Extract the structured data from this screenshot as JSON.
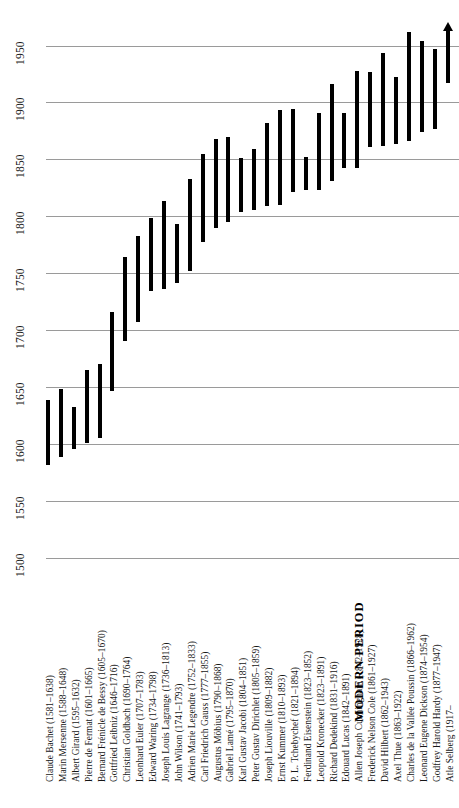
{
  "chart_data": {
    "type": "bar",
    "orientation": "vertical-timeline",
    "title": "",
    "subtitle": "",
    "xlabel": "",
    "ylabel": "",
    "ylim": [
      1500,
      1965
    ],
    "grid": true,
    "legend": null,
    "axis_ticks": [
      1500,
      1550,
      1600,
      1650,
      1700,
      1750,
      1800,
      1850,
      1900,
      1950
    ],
    "tick_labels": [
      "1500",
      "1550",
      "1600",
      "1650",
      "1700",
      "1750",
      "1800",
      "1850",
      "1900",
      "1950"
    ],
    "annotations": [
      {
        "text": "MODERN PERIOD",
        "from_year": 1840,
        "to_year": 1925
      }
    ],
    "categories": [
      "Claude Bachet",
      "Marin Mersenne",
      "Albert Girard",
      "Pierre de Fermat",
      "Bernard Frénicle de Bessy",
      "Gottfried Leibniz",
      "Christian Goldbach",
      "Leonhard Euler",
      "Edward Waring",
      "Joseph Louis Lagrange",
      "John Wilson",
      "Adrien Marie Legendre",
      "Carl Friedrich Gauss",
      "Augustus Möbius",
      "Gabriel Lamé",
      "Karl Gustav Jacobi",
      "Peter Gustav Dirichlet",
      "Joseph Liouville",
      "Ernst Kummer",
      "P. L. Tchebychef",
      "Ferdinand Eisenstein",
      "Leopold Kronecker",
      "Richard Dedekind",
      "Edouard Lucas",
      "Allen Joseph Cunningham",
      "Frederick Nelson Cole",
      "David Hilbert",
      "Axel Thue",
      "Charles de la Vallée Poussin",
      "Leonard Eugene Dickson",
      "Godfrey Harold Hardy",
      "Atle Selberg"
    ],
    "series": [
      {
        "name": "Lifespan",
        "points": [
          {
            "label": "Claude Bachet (1581–1638)",
            "born": 1581,
            "died": 1638,
            "open_ended": false
          },
          {
            "label": "Marin Mersenne (1588–1648)",
            "born": 1588,
            "died": 1648,
            "open_ended": false
          },
          {
            "label": "Albert Girard (1595–1632)",
            "born": 1595,
            "died": 1632,
            "open_ended": false
          },
          {
            "label": "Pierre de Fermat (1601–1665)",
            "born": 1601,
            "died": 1665,
            "open_ended": false
          },
          {
            "label": "Bernard Frénicle de Bessy (1605–1670)",
            "born": 1605,
            "died": 1670,
            "open_ended": false
          },
          {
            "label": "Gottfried Leibniz (1646–1716)",
            "born": 1646,
            "died": 1716,
            "open_ended": false
          },
          {
            "label": "Christian Goldbach (1690–1764)",
            "born": 1690,
            "died": 1764,
            "open_ended": false
          },
          {
            "label": "Leonhard Euler (1707–1783)",
            "born": 1707,
            "died": 1783,
            "open_ended": false
          },
          {
            "label": "Edward Waring (1734–1798)",
            "born": 1734,
            "died": 1798,
            "open_ended": false
          },
          {
            "label": "Joseph Louis Lagrange (1736–1813)",
            "born": 1736,
            "died": 1813,
            "open_ended": false
          },
          {
            "label": "John Wilson (1741–1793)",
            "born": 1741,
            "died": 1793,
            "open_ended": false
          },
          {
            "label": "Adrien Marie Legendre (1752–1833)",
            "born": 1752,
            "died": 1833,
            "open_ended": false
          },
          {
            "label": "Carl Friedrich Gauss (1777–1855)",
            "born": 1777,
            "died": 1855,
            "open_ended": false
          },
          {
            "label": "Augustus Möbius (1790–1868)",
            "born": 1790,
            "died": 1868,
            "open_ended": false
          },
          {
            "label": "Gabriel Lamé (1795–1870)",
            "born": 1795,
            "died": 1870,
            "open_ended": false
          },
          {
            "label": "Karl Gustav Jacobi (1804–1851)",
            "born": 1804,
            "died": 1851,
            "open_ended": false
          },
          {
            "label": "Peter Gustav Dirichlet (1805–1859)",
            "born": 1805,
            "died": 1859,
            "open_ended": false
          },
          {
            "label": "Joseph Liouville (1809–1882)",
            "born": 1809,
            "died": 1882,
            "open_ended": false
          },
          {
            "label": "Ernst Kummer (1810–1893)",
            "born": 1810,
            "died": 1893,
            "open_ended": false
          },
          {
            "label": "P. L. Tchebychef (1821–1894)",
            "born": 1821,
            "died": 1894,
            "open_ended": false
          },
          {
            "label": "Ferdinand Eisenstein (1823–1852)",
            "born": 1823,
            "died": 1852,
            "open_ended": false
          },
          {
            "label": "Leopold Kronecker (1823–1891)",
            "born": 1823,
            "died": 1891,
            "open_ended": false
          },
          {
            "label": "Richard Dedekind (1831–1916)",
            "born": 1831,
            "died": 1916,
            "open_ended": false
          },
          {
            "label": "Edouard Lucas (1842–1891)",
            "born": 1842,
            "died": 1891,
            "open_ended": false
          },
          {
            "label": "Allen Joseph Cunningham (1842–1928)",
            "born": 1842,
            "died": 1928,
            "open_ended": false
          },
          {
            "label": "Frederick Nelson Cole (1861–1927)",
            "born": 1861,
            "died": 1927,
            "open_ended": false
          },
          {
            "label": "David Hilbert (1862–1943)",
            "born": 1862,
            "died": 1943,
            "open_ended": false
          },
          {
            "label": "Axel Thue (1863–1922)",
            "born": 1863,
            "died": 1922,
            "open_ended": false
          },
          {
            "label": "Charles de la Vallée Poussin (1866–1962)",
            "born": 1866,
            "died": 1962,
            "open_ended": false
          },
          {
            "label": "Leonard Eugene Dickson (1874–1954)",
            "born": 1874,
            "died": 1954,
            "open_ended": false
          },
          {
            "label": "Godfrey Harold Hardy (1877–1947)",
            "born": 1877,
            "died": 1947,
            "open_ended": false
          },
          {
            "label": "Atle Selberg (1917–",
            "born": 1917,
            "died": 1963,
            "open_ended": true
          }
        ]
      }
    ]
  },
  "colors": {
    "bar": "#000000",
    "gridline": "#9a9a9a",
    "text": "#161616",
    "background": "#ffffff"
  }
}
